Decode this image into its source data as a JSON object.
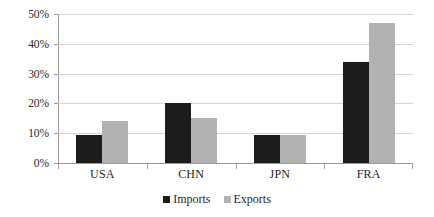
{
  "chart_data": {
    "type": "bar",
    "title": "",
    "subtitle": "",
    "xlabel": "",
    "ylabel": "",
    "categories": [
      "USA",
      "CHN",
      "JPN",
      "FRA"
    ],
    "series": [
      {
        "name": "Imports",
        "color": "#1c1c1c",
        "values": [
          9.3,
          20.2,
          9.5,
          34.0
        ]
      },
      {
        "name": "Exports",
        "color": "#b2b2b2",
        "values": [
          14.0,
          15.0,
          9.4,
          47.0
        ]
      }
    ],
    "ylim": [
      0,
      50
    ],
    "ytick_step": 10,
    "ytick_labels": [
      "0%",
      "10%",
      "20%",
      "30%",
      "40%",
      "50%"
    ],
    "ytick_values": [
      0,
      10,
      20,
      30,
      40,
      50
    ],
    "value_format": "percent",
    "grid": true,
    "grid_axis": "y",
    "legend": true,
    "legend_position": "bottom",
    "annotations": []
  },
  "legend": {
    "items": [
      {
        "label": "Imports"
      },
      {
        "label": "Exports"
      }
    ]
  },
  "colors": {
    "imports": "#1c1c1c",
    "exports": "#b2b2b2",
    "gridline": "#d4d4d4",
    "axis": "#9a9a9a",
    "text": "#1f1f1f",
    "background": "#ffffff"
  }
}
